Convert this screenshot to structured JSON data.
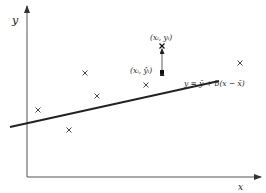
{
  "diagram": {
    "type": "linear-regression-schematic",
    "axes": {
      "x_label": "x",
      "y_label": "y"
    },
    "regression_line": {
      "equation": "y = ȳ + b(x − x̄)",
      "start": [
        10,
        127
      ],
      "end": [
        219,
        82
      ]
    },
    "data_points": [
      {
        "x": 38,
        "y": 110
      },
      {
        "x": 85,
        "y": 73
      },
      {
        "x": 69,
        "y": 130
      },
      {
        "x": 97,
        "y": 96
      },
      {
        "x": 146,
        "y": 85
      },
      {
        "x": 240,
        "y": 63
      }
    ],
    "highlighted": {
      "observed_label": "(xᵢ, yᵢ)",
      "fitted_label": "(xᵢ, ŷᵢ)",
      "observed_point": [
        162,
        46
      ],
      "fitted_point": [
        162,
        73
      ]
    },
    "colors": {
      "line": "#222222",
      "axis": "#444444",
      "background": "#ffffff"
    }
  }
}
